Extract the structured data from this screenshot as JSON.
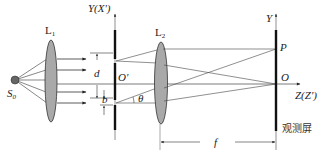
{
  "diagram": {
    "type": "optics-double-slit-fraunhofer",
    "colors": {
      "line": "#444444",
      "lens_fill": "#a9a9a9",
      "lens_stroke": "#333333",
      "screen": "#111111",
      "source": "#666666"
    },
    "labels": {
      "source": "S",
      "source_sub": "0",
      "lens1": "L",
      "lens1_sub": "1",
      "lens2": "L",
      "lens2_sub": "2",
      "slit_axis": "Y(X')",
      "slit_origin": "O'",
      "slit_separation": "d",
      "slit_width": "b",
      "angle": "θ",
      "screen_axis_y": "Y",
      "point_p": "P",
      "screen_origin": "O",
      "optical_axis": "Z(Z')",
      "focal_length": "f",
      "screen_name": "观测屏"
    }
  }
}
